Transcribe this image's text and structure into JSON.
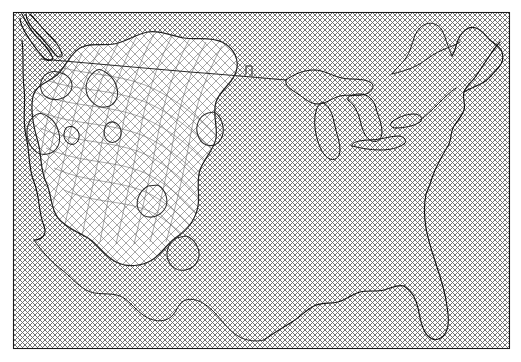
{
  "figure": {
    "title": "",
    "type": "map",
    "width": 521,
    "height": 362,
    "background_color": "#ffffff",
    "frame": {
      "visible": true,
      "color": "#1a1a1a",
      "x": 13,
      "y": 12,
      "width": 496,
      "height": 336
    }
  },
  "legend": {
    "visible": false,
    "entries": []
  },
  "axes": {
    "x_label": "",
    "y_label": "",
    "x_ticks": [],
    "y_ticks": [],
    "grid": false
  },
  "chart_data": {
    "type": "map",
    "title": "",
    "subtitle": "",
    "xlabel": "",
    "ylabel": "",
    "projection": "lambert-conformal-conic",
    "region": "Continental United States (CONUS)",
    "grid": false,
    "legend_position": "none",
    "colors": {
      "background": "#ffffff",
      "frame": "#1a1a1a",
      "coastline": "#141414",
      "border": "#1e1e1e",
      "lake": "#141414",
      "contour": "#222222",
      "hatch_base": "#6e6e6e",
      "hatch_region": "#5d5d5d"
    },
    "layers": [
      {
        "name": "base-significance-hatch",
        "type": "hatch",
        "pattern": "crosshatch-diagonal",
        "spacing_px": 5,
        "angle_deg": 45,
        "line_width": 0.6,
        "color": "#6e6e6e",
        "coverage": "full-map-extent",
        "description": "Fine regular crosshatch covering the entire map domain"
      },
      {
        "name": "western-region-warped-hatch",
        "type": "hatch",
        "pattern": "crosshatch-warped",
        "spacing_px": 9,
        "angle_deg": 45,
        "line_width": 0.55,
        "color": "#5d5d5d",
        "coverage": "western-united-states",
        "description": "Coarser distorted crosshatch bounded by closed contours over the western US"
      },
      {
        "name": "coastlines",
        "type": "line",
        "color": "#141414",
        "line_width": 1.15
      },
      {
        "name": "national-borders",
        "type": "line",
        "color": "#1e1e1e",
        "line_width": 0.95,
        "description": "US-Canada 49th parallel and US-Mexico border"
      },
      {
        "name": "great-lakes",
        "type": "line",
        "color": "#141414",
        "line_width": 1.0,
        "features": [
          "Superior",
          "Michigan",
          "Huron",
          "Erie",
          "Ontario"
        ]
      },
      {
        "name": "contours",
        "type": "contour",
        "color": "#222222",
        "line_width": 1.25,
        "closed": true,
        "count": 7,
        "labels": []
      }
    ],
    "annotations": [],
    "data_labels": []
  }
}
